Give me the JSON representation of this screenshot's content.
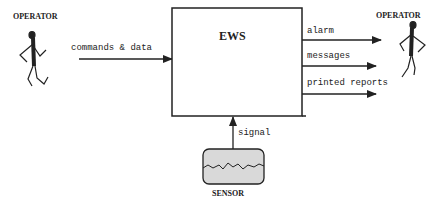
{
  "diagram": {
    "central_system": {
      "label": "EWS"
    },
    "actors": {
      "left_operator": {
        "label": "OPERATOR"
      },
      "right_operator": {
        "label": "OPERATOR"
      },
      "sensor": {
        "label": "SENSOR"
      }
    },
    "flows": {
      "input": {
        "label": "commands & data",
        "from": "left_operator",
        "to": "central_system"
      },
      "outputs": [
        {
          "label": "alarm",
          "from": "central_system",
          "to": "right_operator"
        },
        {
          "label": "messages",
          "from": "central_system",
          "to": "right_operator"
        },
        {
          "label": "printed reports",
          "from": "central_system",
          "to": "right_operator"
        }
      ],
      "sensor_input": {
        "label": "signal",
        "from": "sensor",
        "to": "central_system"
      }
    },
    "colors": {
      "stroke": "#222222",
      "sensor_fill": "#d9d9d9"
    }
  }
}
